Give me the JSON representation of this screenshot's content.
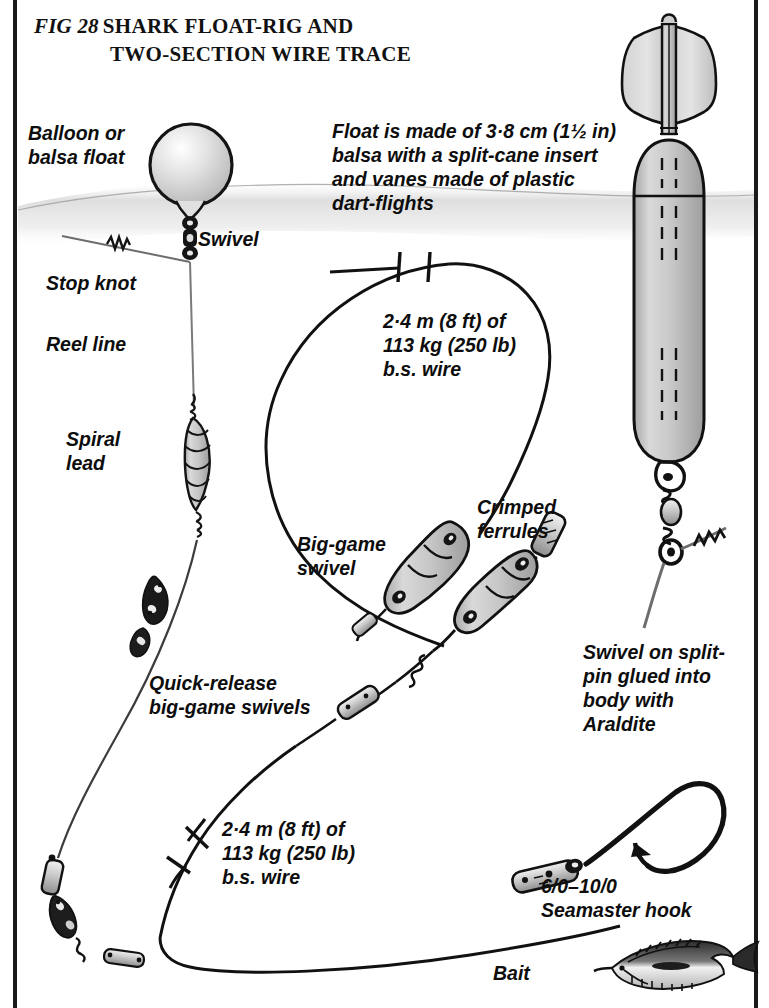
{
  "figure": {
    "number": "FIG 28",
    "title_line1": "SHARK FLOAT-RIG AND",
    "title_line2": "TWO-SECTION WIRE TRACE"
  },
  "labels": {
    "balloon_float": "Balloon or\nbalsa float",
    "swivel": "Swivel",
    "stop_knot": "Stop knot",
    "reel_line": "Reel line",
    "spiral_lead": "Spiral\nlead",
    "float_note": "Float is made of 3·8 cm (1½ in)\nbalsa with a split-cane insert\nand vanes made of plastic\ndart-flights",
    "upper_wire": "2·4 m (8 ft) of\n113 kg (250 lb)\nb.s. wire",
    "lower_wire": "2·4 m (8 ft) of\n113 kg (250 lb)\nb.s. wire",
    "big_game_swivel": "Big-game\nswivel",
    "crimped_ferrules": "Crimped\nferrules",
    "quick_release": "Quick-release\nbig-game swivels",
    "araldite_note": "Swivel on split-\npin glued into\nbody with\nAraldite",
    "hook": "6/0–10/0\nSeamaster hook",
    "bait": "Bait"
  },
  "colors": {
    "ink": "#111111",
    "paper": "#ffffff",
    "water": "#d8d8d8",
    "balsa_light": "#dcdcdc",
    "balsa_mid": "#c2c2c2",
    "balsa_dark": "#9a9a9a",
    "metal": "#cfcfcf"
  }
}
